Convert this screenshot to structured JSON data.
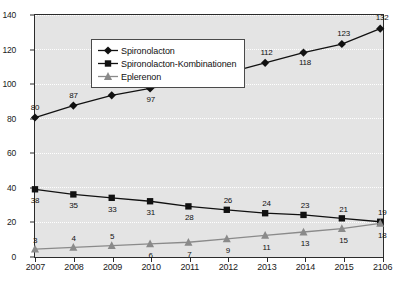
{
  "chart_data": {
    "type": "line",
    "title": "",
    "xlabel": "",
    "ylabel": "(Mio. DDD)",
    "categories": [
      "2007",
      "2008",
      "2009",
      "2010",
      "2011",
      "2012",
      "2013",
      "2014",
      "2015",
      "2106"
    ],
    "ylim": [
      0,
      140
    ],
    "yticks": [
      0,
      20,
      40,
      60,
      80,
      100,
      120,
      140
    ],
    "grid": true,
    "legend_position": "top-left",
    "series": [
      {
        "name": "Spironolacton",
        "marker": "diamond",
        "color": "#111111",
        "values": [
          80,
          87,
          93,
          97,
          101,
          106,
          112,
          118,
          123,
          132
        ],
        "label_side": [
          "above",
          "above",
          "above",
          "below",
          "above",
          "above",
          "above",
          "below",
          "above",
          "above"
        ]
      },
      {
        "name": "Spironolacton-Kombinationen",
        "marker": "square",
        "color": "#111111",
        "values": [
          38,
          35,
          33,
          31,
          28,
          26,
          24,
          23,
          21,
          19
        ],
        "label_side": [
          "below",
          "below",
          "below",
          "below",
          "below",
          "above",
          "above",
          "above",
          "above",
          "above"
        ]
      },
      {
        "name": "Eplerenon",
        "marker": "triangle",
        "color": "#8a8a8a",
        "values": [
          3,
          4,
          5,
          6,
          7,
          9,
          11,
          13,
          15,
          18
        ],
        "label_side": [
          "above",
          "above",
          "above",
          "below",
          "below",
          "below",
          "below",
          "below",
          "below",
          "below"
        ]
      }
    ]
  },
  "style": {
    "plot_background": "#e4e4e4",
    "axis_color": "#2b2b2b",
    "gridline_color": "#ffffff",
    "page_background": "#ffffff"
  }
}
